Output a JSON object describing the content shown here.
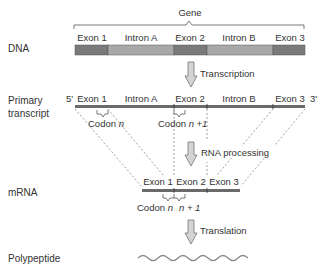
{
  "title": "Gene",
  "rows": {
    "dna": {
      "label": "DNA",
      "segments": [
        {
          "label": "Exon 1",
          "type": "exon"
        },
        {
          "label": "Intron A",
          "type": "intron"
        },
        {
          "label": "Exon 2",
          "type": "exon"
        },
        {
          "label": "Intron B",
          "type": "intron"
        },
        {
          "label": "Exon 3",
          "type": "exon"
        }
      ]
    },
    "primary": {
      "label_line1": "Primary",
      "label_line2": "transcript",
      "five_prime": "5'",
      "three_prime": "3'",
      "segments": [
        {
          "label": "Exon 1"
        },
        {
          "label": "Intron A"
        },
        {
          "label": "Exon 2"
        },
        {
          "label": "Intron B"
        },
        {
          "label": "Exon 3"
        }
      ],
      "codon_a": "Codon",
      "codon_a_var": "n",
      "codon_b": "Codon",
      "codon_b_var": "n +1"
    },
    "mrna": {
      "label": "mRNA",
      "segments": [
        {
          "label": "Exon 1"
        },
        {
          "label": "Exon 2"
        },
        {
          "label": "Exon 3"
        }
      ],
      "codon_a": "Codon",
      "codon_a_var": "n",
      "codon_b_var": "n + 1"
    },
    "polypeptide": {
      "label": "Polypeptide"
    }
  },
  "steps": [
    {
      "label": "Transcription"
    },
    {
      "label": "RNA processing"
    },
    {
      "label": "Translation"
    }
  ],
  "colors": {
    "exon": "#7a7a7a",
    "intron": "#a8a8a8",
    "line": "#6a6a6a",
    "arrow_fill": "#d4d4d4",
    "text": "#333333"
  }
}
